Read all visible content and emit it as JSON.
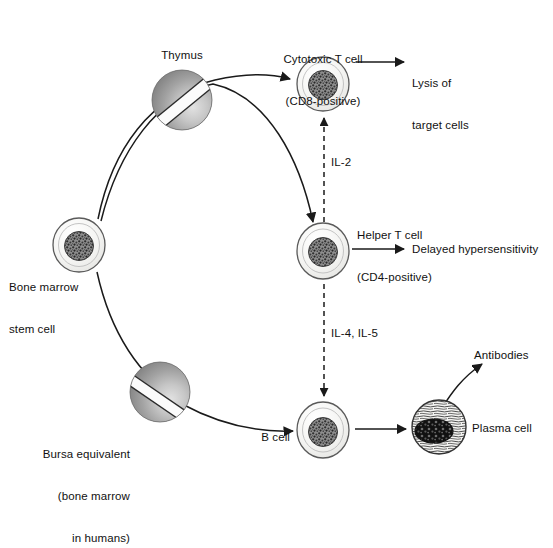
{
  "figure": {
    "background_color": "#ffffff",
    "text_color": "#111111",
    "line_color": "#1a1a1a",
    "organ_color_dark": "#7f7f7f",
    "organ_color_light": "#d8d8d8",
    "cell_outline_color": "#555555",
    "cell_fill_color": "#f2f2f0",
    "nucleus_color": "#3a3a3a"
  },
  "nodes": {
    "stem_cell": {
      "label": "Bone marrow\nstem cell",
      "label_line1": "Bone marrow",
      "label_line2": "stem cell",
      "type": "cell",
      "x": 79,
      "y": 245
    },
    "thymus": {
      "label": "Thymus",
      "type": "organ",
      "x": 182,
      "y": 100
    },
    "bursa": {
      "label": "Bursa equivalent\n(bone marrow\nin humans)",
      "label_line1": "Bursa equivalent",
      "label_line2": "(bone marrow",
      "label_line3": "in humans)",
      "type": "organ",
      "x": 160,
      "y": 392
    },
    "cytotoxic_t_cell": {
      "label": "Cytotoxic T cell\n(CD8-positive)",
      "label_line1": "Cytotoxic T cell",
      "label_line2": "(CD8-positive)",
      "type": "cell",
      "x": 323,
      "y": 84
    },
    "helper_t_cell": {
      "label": "Helper T cell\n(CD4-positive)",
      "label_line1": "Helper T cell",
      "label_line2": "(CD4-positive)",
      "type": "cell",
      "x": 323,
      "y": 250
    },
    "b_cell": {
      "label": "B cell",
      "type": "cell",
      "x": 323,
      "y": 430
    },
    "plasma_cell": {
      "label": "Plasma cell",
      "type": "plasma-cell",
      "x": 439,
      "y": 427
    }
  },
  "outputs": {
    "lysis": {
      "label": "Lysis of\ntarget cells",
      "label_line1": "Lysis of",
      "label_line2": "target cells"
    },
    "delayed_hypersensitivity": {
      "label": "Delayed hypersensitivity"
    },
    "antibodies": {
      "label": "Antibodies"
    }
  },
  "cytokines": {
    "il2": {
      "label": "IL-2",
      "from": "helper_t_cell",
      "to": "cytotoxic_t_cell",
      "style": "dashed",
      "direction": "up"
    },
    "il45": {
      "label": "IL-4, IL-5",
      "from": "helper_t_cell",
      "to": "b_cell",
      "style": "dashed",
      "direction": "down"
    }
  },
  "edges": [
    {
      "from": "stem_cell",
      "to": "cytotoxic_t_cell",
      "via": "thymus",
      "style": "solid"
    },
    {
      "from": "stem_cell",
      "to": "helper_t_cell",
      "via": "thymus",
      "style": "solid"
    },
    {
      "from": "stem_cell",
      "to": "b_cell",
      "via": "bursa",
      "style": "solid"
    },
    {
      "from": "cytotoxic_t_cell",
      "to": "lysis",
      "style": "solid"
    },
    {
      "from": "helper_t_cell",
      "to": "delayed_hypersensitivity",
      "style": "solid"
    },
    {
      "from": "b_cell",
      "to": "plasma_cell",
      "style": "solid"
    },
    {
      "from": "plasma_cell",
      "to": "antibodies",
      "style": "solid-curved"
    }
  ]
}
